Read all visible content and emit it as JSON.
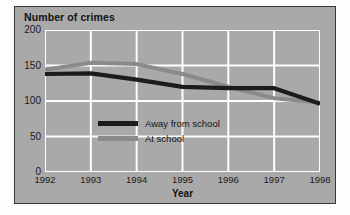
{
  "figure": {
    "title": "Number of crimes",
    "x_axis_label": "Year"
  },
  "legend": {
    "items": [
      {
        "label": "Away from school",
        "swatch": "dark-line-swatch",
        "color": "#1c1c1c"
      },
      {
        "label": "At school",
        "swatch": "gray-line-swatch",
        "color": "#8a8a8a"
      }
    ]
  },
  "axes": {
    "y_ticks": [
      "200",
      "150",
      "100",
      "50",
      "0"
    ],
    "x_ticks": [
      "1992",
      "1993",
      "1994",
      "1995",
      "1996",
      "1997",
      "1998"
    ]
  },
  "colors": {
    "panel_background": "#a9a9a9",
    "panel_border": "#3a3a3a",
    "gridline": "#ffffff",
    "series_away": "#1c1c1c",
    "series_at": "#8a8a8a",
    "page_background": "#fdfdfd"
  },
  "chart_data": {
    "type": "line",
    "title": "Number of crimes",
    "xlabel": "Year",
    "ylabel": "Number of crimes",
    "categories": [
      1992,
      1993,
      1994,
      1995,
      1996,
      1997,
      1998
    ],
    "x": [
      1992,
      1993,
      1994,
      1995,
      1996,
      1997,
      1998
    ],
    "xlim": [
      1992,
      1998
    ],
    "ylim": [
      0,
      200
    ],
    "y_ticks": [
      0,
      50,
      100,
      150,
      200
    ],
    "grid": true,
    "legend_position": "inside-center-lower",
    "series": [
      {
        "name": "Away from school",
        "color": "#1c1c1c",
        "values": [
          138,
          139,
          130,
          120,
          118,
          118,
          96
        ]
      },
      {
        "name": "At school",
        "color": "#8a8a8a",
        "values": [
          144,
          154,
          152,
          138,
          120,
          104,
          98
        ]
      }
    ]
  }
}
